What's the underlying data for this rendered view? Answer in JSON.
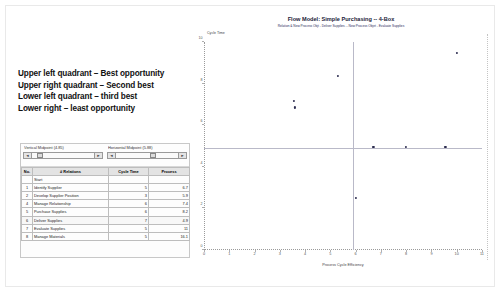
{
  "slide": {
    "notes": [
      "Upper left quadrant – Best opportunity",
      "Upper right quadrant – Second best",
      "Lower left quadrant – third best",
      "Lower right – least opportunity"
    ]
  },
  "spreadsheet": {
    "vertical_midpoint_label": "Vertical Midpoint (4.85)",
    "horizontal_midpoint_label": "Horizontal Midpoint (5.88)",
    "spinner_left": "◄",
    "spinner_right": "►",
    "columns": [
      "No.",
      "# Relations",
      "Cycle Time",
      "Process"
    ],
    "rows": [
      {
        "no": "",
        "relation": "Start",
        "cycle": "",
        "process": ""
      },
      {
        "no": "1",
        "relation": "Identify Supplier",
        "cycle": "5",
        "process": "6.7"
      },
      {
        "no": "2",
        "relation": "Develop Supplier Position",
        "cycle": "3",
        "process": "5.9"
      },
      {
        "no": "4",
        "relation": "Manage Relationship",
        "cycle": "6",
        "process": "7.4"
      },
      {
        "no": "5",
        "relation": "Purchase Supplies",
        "cycle": "6",
        "process": "8.2"
      },
      {
        "no": "6",
        "relation": "Deliver Supplies",
        "cycle": "7",
        "process": "4.9"
      },
      {
        "no": "7",
        "relation": "Evaluate Supplies",
        "cycle": "5",
        "process": "11"
      },
      {
        "no": "8",
        "relation": "Manage Materials",
        "cycle": "5",
        "process": "16.1"
      }
    ]
  },
  "chart_data": {
    "type": "scatter",
    "title": "Flow Model:  Simple Purchasing -- 4-Box",
    "subtitle": "Relation & New Process Objt - Deliver Supplies -- New Process Objet - Evaluate Supplies",
    "xlabel": "Process Cycle Efficiency",
    "ylabel": "Cycle Time",
    "xlim": [
      0,
      11
    ],
    "ylim": [
      0,
      10
    ],
    "xticks": [
      0,
      1,
      2,
      3,
      4,
      5,
      6,
      7,
      8,
      9,
      10,
      11
    ],
    "yticks": [
      0,
      2,
      4,
      6,
      8,
      10
    ],
    "grid": false,
    "legend": "none",
    "vertical_divider": 5.88,
    "horizontal_divider": 4.85,
    "points": [
      {
        "x": 3.55,
        "y": 7.15
      },
      {
        "x": 3.6,
        "y": 6.85
      },
      {
        "x": 5.3,
        "y": 8.35
      },
      {
        "x": 10.0,
        "y": 9.45
      },
      {
        "x": 6.7,
        "y": 4.95
      },
      {
        "x": 8.0,
        "y": 4.95
      },
      {
        "x": 9.55,
        "y": 4.95
      },
      {
        "x": 6.0,
        "y": 2.5
      }
    ]
  }
}
